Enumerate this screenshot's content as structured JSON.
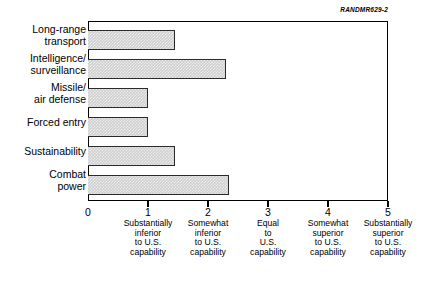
{
  "figure": {
    "id_label": "RANDMR629-2"
  },
  "chart_data": {
    "type": "bar",
    "orientation": "horizontal",
    "title": "",
    "xlabel": "",
    "ylabel": "",
    "xlim": [
      0,
      5
    ],
    "grid": false,
    "legend": null,
    "bar_color": "#cfcfcf",
    "bar_edge_color": "#2b2b2b",
    "categories": [
      "Long-range\ntransport",
      "Intelligence/\nsurveillance",
      "Missile/\nair defense",
      "Forced entry",
      "Sustainability",
      "Combat\npower"
    ],
    "values": [
      1.45,
      2.3,
      1.0,
      1.0,
      1.45,
      2.35
    ],
    "xticks": [
      0,
      1,
      2,
      3,
      4,
      5
    ],
    "xtick_labels": [
      "0",
      "1",
      "2",
      "3",
      "4",
      "5"
    ],
    "xtick_descriptions": [
      "",
      "Substantially\ninferior\nto U.S.\ncapability",
      "Somewhat\ninferior\nto U.S.\ncapability",
      "Equal\nto\nU.S.\ncapability",
      "Somewhat\nsuperior\nto U.S.\ncapability",
      "Substantially\nsuperior\nto U.S.\ncapability"
    ]
  }
}
